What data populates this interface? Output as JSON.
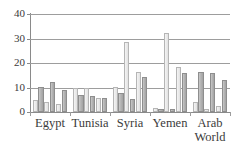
{
  "chart_data": {
    "type": "bar",
    "title": "",
    "subtitle": "",
    "xlabel": "",
    "ylabel": "",
    "ylim": [
      0,
      40
    ],
    "yticks": [
      0,
      10,
      20,
      30,
      40
    ],
    "grid": true,
    "legend": "none",
    "orientation": "vertical",
    "grouping": "clustered",
    "categories": [
      "Egypt",
      "Tunisia",
      "Syria",
      "Yemen",
      "Arab World"
    ],
    "category_lines": [
      [
        "Egypt"
      ],
      [
        "Tunisia"
      ],
      [
        "Syria"
      ],
      [
        "Yemen"
      ],
      [
        "Arab",
        "World"
      ]
    ],
    "series": [
      {
        "name": "Series 1",
        "style": "light",
        "values": [
          5.0,
          9.8,
          10.3,
          1.8,
          4.0
        ]
      },
      {
        "name": "Series 2",
        "style": "dark",
        "values": [
          10.3,
          7.0,
          7.6,
          1.4,
          16.3
        ]
      },
      {
        "name": "Series 3",
        "style": "light",
        "values": [
          4.2,
          9.6,
          28.6,
          32.4,
          1.3
        ]
      },
      {
        "name": "Series 4",
        "style": "dark",
        "values": [
          12.4,
          6.4,
          5.5,
          1.2,
          15.8
        ]
      },
      {
        "name": "Series 5",
        "style": "light",
        "values": [
          3.2,
          5.8,
          16.2,
          18.5,
          2.6
        ]
      },
      {
        "name": "Series 6",
        "style": "dark",
        "values": [
          9.0,
          5.7,
          14.1,
          15.9,
          12.9
        ]
      }
    ],
    "group_bar_styles": [
      [
        "light",
        "dark",
        "light",
        "dark",
        "light",
        "dark"
      ],
      [
        "light",
        "dark",
        "light",
        "dark",
        "light",
        "dark"
      ],
      [
        "light",
        "dark",
        "light",
        "dark",
        "light",
        "dark"
      ],
      [
        "light",
        "dark",
        "light",
        "dark",
        "light",
        "dark"
      ],
      [
        "light",
        "dark",
        "light",
        "dark",
        "light",
        "dark"
      ]
    ],
    "group_values": [
      [
        5.0,
        10.3,
        4.2,
        12.4,
        3.2,
        9.0
      ],
      [
        9.8,
        7.0,
        9.6,
        6.4,
        5.8,
        5.7
      ],
      [
        10.3,
        7.6,
        28.6,
        5.5,
        16.2,
        14.1
      ],
      [
        1.8,
        1.4,
        32.4,
        1.2,
        18.5,
        15.9
      ],
      [
        4.0,
        16.3,
        1.3,
        15.8,
        2.6,
        12.9
      ]
    ]
  },
  "axis": {
    "y_labels": [
      "40",
      "30",
      "20",
      "10",
      "0"
    ]
  }
}
